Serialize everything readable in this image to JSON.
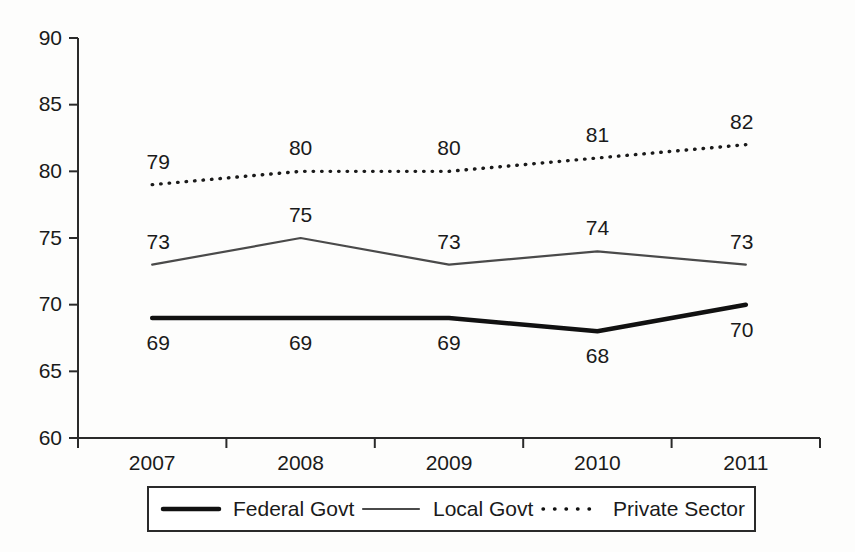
{
  "chart_data": {
    "type": "line",
    "title": "",
    "xlabel": "",
    "ylabel": "",
    "categories": [
      "2007",
      "2008",
      "2009",
      "2010",
      "2011"
    ],
    "ylim": [
      60,
      90
    ],
    "yticks": [
      60,
      65,
      70,
      75,
      80,
      85,
      90
    ],
    "grid": false,
    "legend_position": "bottom",
    "series": [
      {
        "name": "Federal Govt",
        "style": "solid-thick",
        "color": "#111111",
        "values": [
          69,
          69,
          69,
          68,
          70
        ],
        "labels": [
          "69",
          "69",
          "69",
          "68",
          "70"
        ],
        "label_side": [
          "below",
          "below",
          "below",
          "below",
          "below"
        ]
      },
      {
        "name": "Local Govt",
        "style": "solid-thin",
        "color": "#4a4a4a",
        "values": [
          73,
          75,
          73,
          74,
          73
        ],
        "labels": [
          "73",
          "75",
          "73",
          "74",
          "73"
        ],
        "label_side": [
          "above",
          "above",
          "above",
          "above",
          "above"
        ]
      },
      {
        "name": "Private Sector",
        "style": "dotted",
        "color": "#1a1a1a",
        "values": [
          79,
          80,
          80,
          81,
          82
        ],
        "labels": [
          "79",
          "80",
          "80",
          "81",
          "82"
        ],
        "label_side": [
          "above",
          "above",
          "above",
          "above",
          "above"
        ]
      }
    ]
  },
  "axis": {
    "y_tick_labels": [
      "90",
      "85",
      "80",
      "75",
      "70",
      "65",
      "60"
    ],
    "x_tick_labels": [
      "2007",
      "2008",
      "2009",
      "2010",
      "2011"
    ]
  },
  "legend": {
    "items": [
      {
        "label": "Federal Govt",
        "style": "solid-thick"
      },
      {
        "label": "Local Govt",
        "style": "solid-thin"
      },
      {
        "label": "Private Sector",
        "style": "dotted"
      }
    ]
  }
}
